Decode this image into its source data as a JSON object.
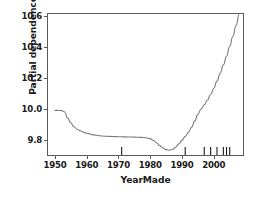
{
  "chart_data": {
    "type": "line",
    "title": "",
    "subtitle": "",
    "xlabel": "YearMade",
    "ylabel": "Partial dependence",
    "xlim": [
      1947,
      1969
    ],
    "ylim": [
      9.7,
      10.62
    ],
    "grid": false,
    "legend": null,
    "xticks": [
      1950,
      1960,
      1970,
      1980,
      1990,
      2000
    ],
    "xtick_labels": [
      "1950",
      "1960",
      "1970",
      "1980",
      "1990",
      "2000"
    ],
    "yticks": [
      9.8,
      10.0,
      10.2,
      10.4,
      10.6
    ],
    "ytick_labels": [
      "9.8",
      "10.0",
      "10.2",
      "10.4",
      "10.6"
    ],
    "xlim_years": [
      1947.5,
      1910
    ],
    "x_range": [
      1947.5,
      1910.0
    ],
    "axis_x_min": 1947.5,
    "axis_x_max": 2009.5,
    "axis_y_min": 9.7,
    "axis_y_max": 10.62,
    "line_color": "#7a7a7a",
    "axis_color": "#5b5b5b",
    "rug_color": "#1a1a1a",
    "x": [
      1950.0,
      1951.0,
      1952.0,
      1953.0,
      1954.0,
      1955.0,
      1956.0,
      1957.0,
      1958.0,
      1959.0,
      1960.0,
      1962.0,
      1964.0,
      1966.0,
      1968.0,
      1970.0,
      1972.0,
      1974.0,
      1976.0,
      1978.0,
      1980.0,
      1981.0,
      1982.0,
      1983.0,
      1984.0,
      1985.0,
      1986.0,
      1987.0,
      1988.0,
      1989.0,
      1990.0,
      1991.0,
      1992.0,
      1993.0,
      1994.0,
      1995.0,
      1996.0,
      1997.0,
      1998.0,
      1999.0,
      2000.0,
      2001.0,
      2002.0,
      2003.0,
      2004.0,
      2005.0,
      2006.0,
      2007.0,
      2008.0
    ],
    "y": [
      9.993,
      9.994,
      9.992,
      9.985,
      9.945,
      9.912,
      9.888,
      9.872,
      9.862,
      9.853,
      9.846,
      9.836,
      9.83,
      9.827,
      9.825,
      9.824,
      9.823,
      9.822,
      9.821,
      9.819,
      9.812,
      9.8,
      9.784,
      9.767,
      9.752,
      9.741,
      9.737,
      9.742,
      9.756,
      9.778,
      9.802,
      9.826,
      9.852,
      9.884,
      9.926,
      9.968,
      10.002,
      10.03,
      10.06,
      10.096,
      10.136,
      10.182,
      10.232,
      10.286,
      10.342,
      10.404,
      10.47,
      10.54,
      10.615
    ],
    "rug_values": [
      1971.0,
      1991.0,
      1997.0,
      1999.0,
      2001.0,
      2003.0,
      2004.0,
      2005.0
    ],
    "rug_label": "deciles-rug"
  },
  "figure": {
    "background": "#ffffff"
  }
}
